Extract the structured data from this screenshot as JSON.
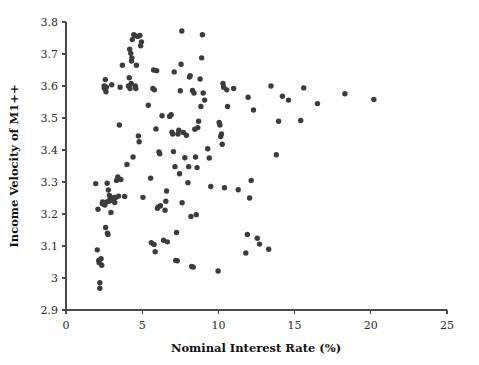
{
  "chart_data": {
    "type": "scatter",
    "title": "",
    "subtitle": "",
    "xlabel": "Nominal Interest Rate (%)",
    "ylabel": "Income Velocity of M1++",
    "xlim": [
      0,
      25
    ],
    "ylim": [
      2.9,
      3.8
    ],
    "xticks": [
      0,
      5,
      10,
      15,
      20,
      25
    ],
    "yticks": [
      2.9,
      3.0,
      3.1,
      3.2,
      3.3,
      3.4,
      3.5,
      3.6,
      3.7,
      3.8
    ],
    "xtick_labels": [
      "0",
      "5",
      "10",
      "15",
      "20",
      "25"
    ],
    "ytick_labels": [
      "2.9",
      "3",
      "3.1",
      "3.2",
      "3.3",
      "3.4",
      "3.5",
      "3.6",
      "3.7",
      "3.8"
    ],
    "grid": false,
    "legend": null,
    "legend_position": "none",
    "marker": {
      "shape": "circle",
      "color": "#3c3c3c",
      "size_px": 5.4
    },
    "point_count": 160,
    "series": [
      {
        "name": "Observations",
        "color": "#3c3c3c",
        "points": [
          [
            1.95,
            3.295
          ],
          [
            2.05,
            3.088
          ],
          [
            2.1,
            3.215
          ],
          [
            2.15,
            3.055
          ],
          [
            2.18,
            3.048
          ],
          [
            2.22,
            2.985
          ],
          [
            2.22,
            2.968
          ],
          [
            2.3,
            3.06
          ],
          [
            2.35,
            3.04
          ],
          [
            2.38,
            3.232
          ],
          [
            2.4,
            3.238
          ],
          [
            2.45,
            3.235
          ],
          [
            2.5,
            3.6
          ],
          [
            2.52,
            3.592
          ],
          [
            2.55,
            3.228
          ],
          [
            2.58,
            3.62
          ],
          [
            2.6,
            3.158
          ],
          [
            2.62,
            3.582
          ],
          [
            2.65,
            3.596
          ],
          [
            2.68,
            3.238
          ],
          [
            2.7,
            3.296
          ],
          [
            2.72,
            3.14
          ],
          [
            2.75,
            3.136
          ],
          [
            2.78,
            3.275
          ],
          [
            2.8,
            3.24
          ],
          [
            2.85,
            3.258
          ],
          [
            2.88,
            3.242
          ],
          [
            2.92,
            3.248
          ],
          [
            2.95,
            3.205
          ],
          [
            3.0,
            3.604
          ],
          [
            3.05,
            3.247
          ],
          [
            3.1,
            3.244
          ],
          [
            3.15,
            3.252
          ],
          [
            3.2,
            3.236
          ],
          [
            3.28,
            3.252
          ],
          [
            3.32,
            3.305
          ],
          [
            3.4,
            3.316
          ],
          [
            3.45,
            3.256
          ],
          [
            3.5,
            3.478
          ],
          [
            3.55,
            3.596
          ],
          [
            3.6,
            3.308
          ],
          [
            3.7,
            3.665
          ],
          [
            3.85,
            3.255
          ],
          [
            4.0,
            3.355
          ],
          [
            4.1,
            3.6
          ],
          [
            4.15,
            3.626
          ],
          [
            4.18,
            3.715
          ],
          [
            4.2,
            3.592
          ],
          [
            4.25,
            3.702
          ],
          [
            4.28,
            3.608
          ],
          [
            4.3,
            3.678
          ],
          [
            4.32,
            3.688
          ],
          [
            4.35,
            3.745
          ],
          [
            4.4,
            3.378
          ],
          [
            4.45,
            3.76
          ],
          [
            4.5,
            3.758
          ],
          [
            4.55,
            3.6
          ],
          [
            4.58,
            3.592
          ],
          [
            4.62,
            3.665
          ],
          [
            4.7,
            3.755
          ],
          [
            4.75,
            3.444
          ],
          [
            4.8,
            3.426
          ],
          [
            4.85,
            3.758
          ],
          [
            4.9,
            3.726
          ],
          [
            4.95,
            3.738
          ],
          [
            5.05,
            3.252
          ],
          [
            5.4,
            3.54
          ],
          [
            5.55,
            3.312
          ],
          [
            5.6,
            3.11
          ],
          [
            5.7,
            3.592
          ],
          [
            5.75,
            3.65
          ],
          [
            5.78,
            3.105
          ],
          [
            5.8,
            3.588
          ],
          [
            5.85,
            3.082
          ],
          [
            5.9,
            3.466
          ],
          [
            5.95,
            3.648
          ],
          [
            6.0,
            3.218
          ],
          [
            6.05,
            3.222
          ],
          [
            6.1,
            3.394
          ],
          [
            6.15,
            3.388
          ],
          [
            6.2,
            3.226
          ],
          [
            6.3,
            3.507
          ],
          [
            6.4,
            3.118
          ],
          [
            6.5,
            3.212
          ],
          [
            6.55,
            3.24
          ],
          [
            6.6,
            3.272
          ],
          [
            6.65,
            3.113
          ],
          [
            6.8,
            3.505
          ],
          [
            6.9,
            3.51
          ],
          [
            6.95,
            3.456
          ],
          [
            7.0,
            3.45
          ],
          [
            7.05,
            3.395
          ],
          [
            7.1,
            3.644
          ],
          [
            7.15,
            3.348
          ],
          [
            7.2,
            3.055
          ],
          [
            7.25,
            3.142
          ],
          [
            7.3,
            3.054
          ],
          [
            7.35,
            3.45
          ],
          [
            7.4,
            3.462
          ],
          [
            7.45,
            3.326
          ],
          [
            7.5,
            3.585
          ],
          [
            7.55,
            3.668
          ],
          [
            7.6,
            3.772
          ],
          [
            7.62,
            3.235
          ],
          [
            7.7,
            3.455
          ],
          [
            7.8,
            3.376
          ],
          [
            7.9,
            3.446
          ],
          [
            8.0,
            3.298
          ],
          [
            8.05,
            3.348
          ],
          [
            8.1,
            3.628
          ],
          [
            8.15,
            3.632
          ],
          [
            8.2,
            3.192
          ],
          [
            8.25,
            3.036
          ],
          [
            8.3,
            3.586
          ],
          [
            8.35,
            3.034
          ],
          [
            8.4,
            3.578
          ],
          [
            8.45,
            3.465
          ],
          [
            8.5,
            3.378
          ],
          [
            8.55,
            3.198
          ],
          [
            8.6,
            3.345
          ],
          [
            8.65,
            3.47
          ],
          [
            8.7,
            3.49
          ],
          [
            8.8,
            3.622
          ],
          [
            8.85,
            3.536
          ],
          [
            8.9,
            3.688
          ],
          [
            8.95,
            3.76
          ],
          [
            9.0,
            3.578
          ],
          [
            9.1,
            3.556
          ],
          [
            9.3,
            3.404
          ],
          [
            9.4,
            3.375
          ],
          [
            9.5,
            3.286
          ],
          [
            9.98,
            3.022
          ],
          [
            10.05,
            3.486
          ],
          [
            10.1,
            3.478
          ],
          [
            10.15,
            3.442
          ],
          [
            10.2,
            3.45
          ],
          [
            10.25,
            3.418
          ],
          [
            10.3,
            3.608
          ],
          [
            10.35,
            3.596
          ],
          [
            10.4,
            3.282
          ],
          [
            10.55,
            3.588
          ],
          [
            10.6,
            3.536
          ],
          [
            11.0,
            3.592
          ],
          [
            11.3,
            3.276
          ],
          [
            11.8,
            3.078
          ],
          [
            11.9,
            3.136
          ],
          [
            11.95,
            3.565
          ],
          [
            12.05,
            3.25
          ],
          [
            12.15,
            3.305
          ],
          [
            12.3,
            3.525
          ],
          [
            12.55,
            3.124
          ],
          [
            12.7,
            3.106
          ],
          [
            13.3,
            3.09
          ],
          [
            13.45,
            3.6
          ],
          [
            13.8,
            3.385
          ],
          [
            13.95,
            3.49
          ],
          [
            14.2,
            3.568
          ],
          [
            14.6,
            3.556
          ],
          [
            15.4,
            3.492
          ],
          [
            15.6,
            3.594
          ],
          [
            16.5,
            3.545
          ],
          [
            18.3,
            3.576
          ],
          [
            20.2,
            3.558
          ]
        ]
      }
    ]
  },
  "plot_geometry": {
    "left_px": 66,
    "right_px": 447,
    "top_px": 22,
    "bottom_px": 310
  }
}
